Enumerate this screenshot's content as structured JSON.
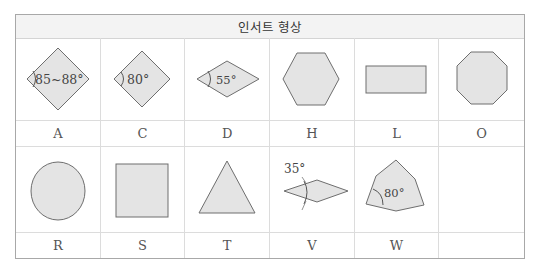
{
  "header": {
    "title": "인서트 형상"
  },
  "shapes_row1": [
    {
      "code": "A",
      "shape": "rhombus-85-88",
      "angle_label": "85~88°"
    },
    {
      "code": "C",
      "shape": "rhombus-80",
      "angle_label": "80°"
    },
    {
      "code": "D",
      "shape": "rhombus-55",
      "angle_label": "55°"
    },
    {
      "code": "H",
      "shape": "hexagon",
      "angle_label": ""
    },
    {
      "code": "L",
      "shape": "rectangle",
      "angle_label": ""
    },
    {
      "code": "O",
      "shape": "octagon",
      "angle_label": ""
    }
  ],
  "shapes_row2": [
    {
      "code": "R",
      "shape": "circle",
      "angle_label": ""
    },
    {
      "code": "S",
      "shape": "square",
      "angle_label": ""
    },
    {
      "code": "T",
      "shape": "triangle",
      "angle_label": ""
    },
    {
      "code": "V",
      "shape": "rhombus-35",
      "angle_label": "35°"
    },
    {
      "code": "W",
      "shape": "trigon",
      "angle_label": "80°"
    },
    {
      "code": "",
      "shape": "empty",
      "angle_label": ""
    }
  ]
}
